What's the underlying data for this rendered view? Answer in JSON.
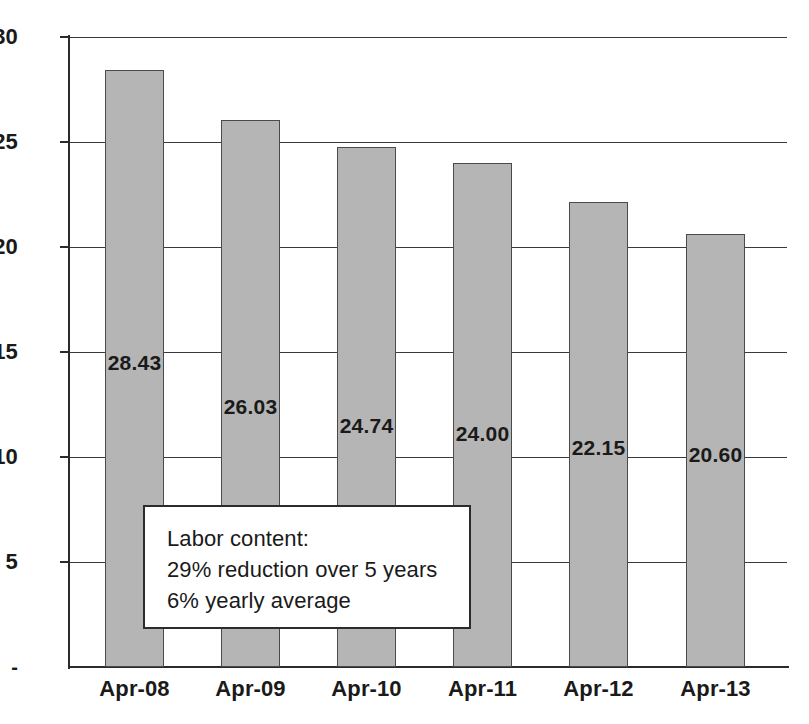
{
  "chart_data": {
    "type": "bar",
    "title": "",
    "subtitle": "",
    "xlabel": "",
    "ylabel": "",
    "categories": [
      "Apr-08",
      "Apr-09",
      "Apr-10",
      "Apr-11",
      "Apr-12",
      "Apr-13"
    ],
    "values": [
      28.43,
      26.03,
      24.74,
      24.0,
      22.15,
      20.6
    ],
    "data_labels": [
      "28.43",
      "26.03",
      "24.74",
      "24.00",
      "22.15",
      "20.60"
    ],
    "ylim": [
      0,
      30
    ],
    "yticks": [
      30,
      25,
      20,
      15,
      10,
      5,
      0
    ],
    "ytick_labels": [
      "30",
      "25",
      "20",
      "15",
      "10",
      "5",
      "-"
    ],
    "grid": true,
    "grid_axis": "y",
    "legend": false,
    "legend_position": "none",
    "bar_fill_color": "#b5b5b5",
    "bar_edge_color": "#4a4a4a",
    "axis_color": "#2b2b2b",
    "text_color": "#1a1a1a",
    "background_color": "#ffffff",
    "annotations": [
      {
        "name": "labor-content-callout",
        "lines": [
          "Labor content:",
          "29% reduction over 5 years",
          "6% yearly average"
        ]
      }
    ]
  }
}
